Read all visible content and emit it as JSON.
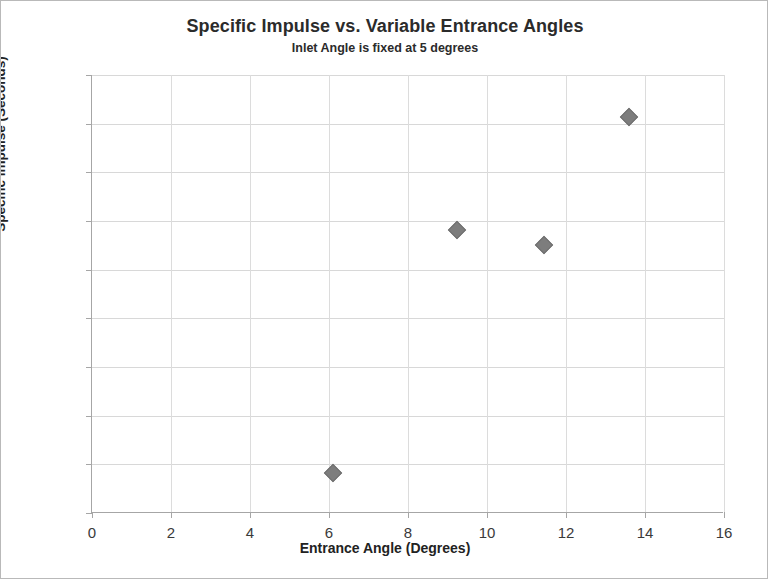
{
  "chart_data": {
    "type": "scatter",
    "title": "Specific Impulse vs. Variable Entrance Angles",
    "subtitle": "Inlet Angle is fixed at 5 degrees",
    "xlabel": "Entrance Angle (Degrees)",
    "ylabel": "Specific Impulse (Seconds)",
    "xlim": [
      0,
      16
    ],
    "ylim": [
      935,
      980
    ],
    "xticks": [
      0,
      2,
      4,
      6,
      8,
      10,
      12,
      14,
      16
    ],
    "yticks": [
      935,
      940,
      945,
      950,
      955,
      960,
      965,
      970,
      975,
      980
    ],
    "grid": true,
    "legend": false,
    "marker_color": "#7d7d7d",
    "marker_shape": "diamond",
    "points": [
      {
        "x": 6.1,
        "y": 939.1
      },
      {
        "x": 9.25,
        "y": 964.1
      },
      {
        "x": 11.45,
        "y": 962.5
      },
      {
        "x": 13.6,
        "y": 975.7
      }
    ],
    "series": [
      {
        "name": "Specific Impulse",
        "x": [
          6.1,
          9.25,
          11.45,
          13.6
        ],
        "values": [
          939.1,
          964.1,
          962.5,
          975.7
        ]
      }
    ]
  }
}
